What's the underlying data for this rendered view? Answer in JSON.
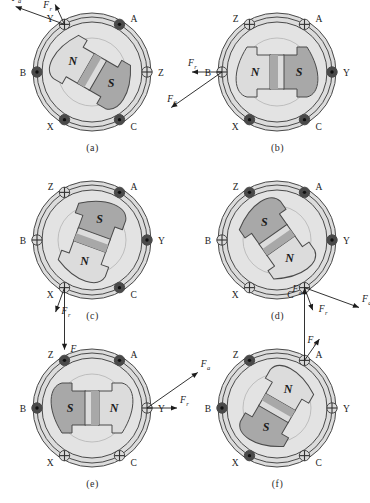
{
  "figure": {
    "title_strip": "",
    "stray_mark": "",
    "domain": "engineering-diagram",
    "colors": {
      "outer_ring_fill": "#dcdcdc",
      "stator_fill": "#e3e3e3",
      "rotor_light": "#dcdcdc",
      "rotor_dark": "#a8a8a8",
      "coil_dark": "#4a4a4a",
      "coil_light": "#dadada",
      "stroke": "#4a4a4a",
      "text": "#1b1b1b"
    },
    "legend": {
      "current_out_symbol": "dot",
      "current_in_symbol": "cross",
      "force_axial": "F",
      "force_axial_sub": "a",
      "force_tangential": "F",
      "force_tangential_sub": "r"
    },
    "pole_labels": {
      "north": "N",
      "south": "S"
    },
    "coil_labels": [
      "A",
      "B",
      "C",
      "X",
      "Y",
      "Z"
    ],
    "panels": [
      {
        "id": "a",
        "caption": "(a)",
        "rotor_angle_deg": 150,
        "north_pole": "N",
        "south_pole": "S",
        "coils": [
          {
            "label": "A",
            "angle_deg": 60,
            "state": "out",
            "label_side": "right"
          },
          {
            "label": "Y",
            "angle_deg": 120,
            "state": "in",
            "label_side": "left"
          },
          {
            "label": "B",
            "angle_deg": 180,
            "state": "out",
            "label_side": "left"
          },
          {
            "label": "X",
            "angle_deg": 240,
            "state": "out",
            "label_side": "left"
          },
          {
            "label": "C",
            "angle_deg": 300,
            "state": "out",
            "label_side": "right"
          },
          {
            "label": "Z",
            "angle_deg": 0,
            "state": "in",
            "label_side": "right"
          }
        ],
        "forces": [
          {
            "name": "F",
            "sub": "r",
            "origin_coil": "Y",
            "direction_deg": 115,
            "length": 22
          },
          {
            "name": "F",
            "sub": "a",
            "origin_coil": "Y",
            "direction_deg": 160,
            "length": 52
          }
        ]
      },
      {
        "id": "b",
        "caption": "(b)",
        "rotor_angle_deg": 180,
        "north_pole": "N",
        "south_pole": "S",
        "coils": [
          {
            "label": "A",
            "angle_deg": 60,
            "state": "in",
            "label_side": "right"
          },
          {
            "label": "Z",
            "angle_deg": 120,
            "state": "in",
            "label_side": "left"
          },
          {
            "label": "B",
            "angle_deg": 180,
            "state": "in",
            "label_side": "left"
          },
          {
            "label": "X",
            "angle_deg": 240,
            "state": "out",
            "label_side": "left"
          },
          {
            "label": "C",
            "angle_deg": 300,
            "state": "out",
            "label_side": "right"
          },
          {
            "label": "Y",
            "angle_deg": 0,
            "state": "out",
            "label_side": "right"
          }
        ],
        "forces": [
          {
            "name": "F",
            "sub": "r",
            "origin_coil": "B",
            "direction_deg": 180,
            "length": 30
          },
          {
            "name": "F",
            "sub": "a",
            "origin_coil": "B",
            "direction_deg": 215,
            "length": 62
          }
        ]
      },
      {
        "id": "c",
        "caption": "(c)",
        "rotor_angle_deg": 250,
        "north_pole": "N",
        "south_pole": "S",
        "coils": [
          {
            "label": "A",
            "angle_deg": 60,
            "state": "out",
            "label_side": "right"
          },
          {
            "label": "Z",
            "angle_deg": 120,
            "state": "in",
            "label_side": "left"
          },
          {
            "label": "B",
            "angle_deg": 180,
            "state": "in",
            "label_side": "left"
          },
          {
            "label": "X",
            "angle_deg": 240,
            "state": "in",
            "label_side": "left"
          },
          {
            "label": "C",
            "angle_deg": 300,
            "state": "out",
            "label_side": "right"
          },
          {
            "label": "Y",
            "angle_deg": 0,
            "state": "out",
            "label_side": "right"
          }
        ],
        "forces": [
          {
            "name": "F",
            "sub": "r",
            "origin_coil": "X",
            "direction_deg": 250,
            "length": 26
          },
          {
            "name": "F",
            "sub": "a",
            "origin_coil": "X",
            "direction_deg": 270,
            "length": 62
          }
        ]
      },
      {
        "id": "d",
        "caption": "(d)",
        "rotor_angle_deg": 305,
        "north_pole": "N",
        "south_pole": "S",
        "coils": [
          {
            "label": "A",
            "angle_deg": 60,
            "state": "out",
            "label_side": "right"
          },
          {
            "label": "Z",
            "angle_deg": 120,
            "state": "out",
            "label_side": "left"
          },
          {
            "label": "B",
            "angle_deg": 180,
            "state": "in",
            "label_side": "left"
          },
          {
            "label": "X",
            "angle_deg": 240,
            "state": "in",
            "label_side": "left"
          },
          {
            "label": "C",
            "angle_deg": 300,
            "state": "in",
            "label_side": "left"
          },
          {
            "label": "Y",
            "angle_deg": 0,
            "state": "out",
            "label_side": "right"
          }
        ],
        "forces": [
          {
            "name": "F",
            "sub": "a",
            "origin_coil": "C",
            "direction_deg": 340,
            "length": 58
          },
          {
            "name": "F",
            "sub": "r",
            "origin_coil": "C",
            "direction_deg": 290,
            "length": 24
          }
        ]
      },
      {
        "id": "e",
        "caption": "(e)",
        "rotor_angle_deg": 0,
        "north_pole": "N",
        "south_pole": "S",
        "coils": [
          {
            "label": "A",
            "angle_deg": 60,
            "state": "out",
            "label_side": "right"
          },
          {
            "label": "Z",
            "angle_deg": 120,
            "state": "out",
            "label_side": "left"
          },
          {
            "label": "B",
            "angle_deg": 180,
            "state": "out",
            "label_side": "left"
          },
          {
            "label": "X",
            "angle_deg": 240,
            "state": "in",
            "label_side": "left"
          },
          {
            "label": "C",
            "angle_deg": 300,
            "state": "in",
            "label_side": "right"
          },
          {
            "label": "Y",
            "angle_deg": 0,
            "state": "in",
            "label_side": "right"
          }
        ],
        "forces": [
          {
            "name": "F",
            "sub": "a",
            "origin_coil": "Y",
            "direction_deg": 35,
            "length": 62
          },
          {
            "name": "F",
            "sub": "r",
            "origin_coil": "Y",
            "direction_deg": 0,
            "length": 30
          }
        ]
      },
      {
        "id": "f",
        "caption": "(f)",
        "rotor_angle_deg": 60,
        "north_pole": "N",
        "south_pole": "S",
        "coils": [
          {
            "label": "A",
            "angle_deg": 60,
            "state": "in",
            "label_side": "right"
          },
          {
            "label": "Z",
            "angle_deg": 120,
            "state": "out",
            "label_side": "left"
          },
          {
            "label": "B",
            "angle_deg": 180,
            "state": "out",
            "label_side": "left"
          },
          {
            "label": "X",
            "angle_deg": 240,
            "state": "out",
            "label_side": "left"
          },
          {
            "label": "C",
            "angle_deg": 300,
            "state": "in",
            "label_side": "right"
          },
          {
            "label": "Y",
            "angle_deg": 0,
            "state": "in",
            "label_side": "right"
          }
        ],
        "forces": [
          {
            "name": "F",
            "sub": "a",
            "origin_coil": "A",
            "direction_deg": 90,
            "length": 72
          },
          {
            "name": "F",
            "sub": "r",
            "origin_coil": "A",
            "direction_deg": 55,
            "length": 26
          }
        ]
      }
    ]
  }
}
